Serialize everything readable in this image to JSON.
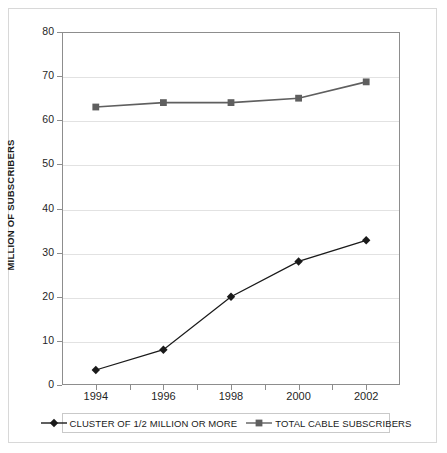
{
  "chart_data": {
    "type": "line",
    "title": "",
    "subtitle": "",
    "xlabel": "",
    "ylabel": "MILLION OF SUBSCRIBERS",
    "x": [
      1994,
      1996,
      1998,
      2000,
      2002
    ],
    "xtick_labels": [
      "1994",
      "1996",
      "1998",
      "2000",
      "2002"
    ],
    "ytick_labels": [
      "0",
      "10",
      "20",
      "30",
      "40",
      "50",
      "60",
      "70",
      "80"
    ],
    "ytick_values": [
      0,
      10,
      20,
      30,
      40,
      50,
      60,
      70,
      80
    ],
    "ylim": [
      0,
      80
    ],
    "grid": "horizontal",
    "legend_position": "bottom",
    "series": [
      {
        "name": "CLUSTER OF 1/2 MILLION OR MORE",
        "marker": "diamond",
        "color": "#1a1a1a",
        "values": [
          3.4,
          8.0,
          20.0,
          28.0,
          32.8
        ]
      },
      {
        "name": "TOTAL CABLE SUBSCRIBERS",
        "marker": "square",
        "color": "#5f5f5f",
        "values": [
          63.0,
          64.0,
          64.0,
          65.0,
          68.7
        ]
      }
    ]
  },
  "legend": {
    "entries": [
      {
        "label": "CLUSTER OF 1/2 MILLION OR MORE",
        "marker": "diamond-marker-icon"
      },
      {
        "label": "TOTAL CABLE SUBSCRIBERS",
        "marker": "square-marker-icon"
      }
    ]
  },
  "axes": {
    "y_title": "MILLION OF SUBSCRIBERS"
  }
}
